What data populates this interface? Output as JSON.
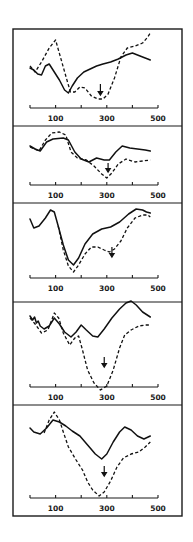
{
  "figure": {
    "width": 193,
    "height": 542,
    "frame": {
      "left": 13,
      "right": 182,
      "top": 29,
      "bottom": 516
    },
    "x_axis_px": {
      "x0": 30,
      "x500": 158
    },
    "panel_tops": [
      29,
      126,
      203,
      302,
      405
    ],
    "colors": {
      "ink": "#111111",
      "background": "#ffffff"
    }
  },
  "chart_data": {
    "type": "line",
    "title": "",
    "xlabel": "",
    "ylabel": "",
    "xlim": [
      0,
      500
    ],
    "x_tick_positions": [
      0,
      100,
      200,
      300,
      400,
      500
    ],
    "x_tick_labels": [
      "100",
      "300",
      "500"
    ],
    "x_tick_label_positions": [
      100,
      300,
      500
    ],
    "grid": false,
    "legend": null,
    "panels": [
      {
        "index": 1,
        "axis_y": 108,
        "label_y": 121,
        "arrow": {
          "x": 275,
          "y_top": 84,
          "y_bottom": 95
        },
        "series": [
          {
            "name": "solid",
            "style": "solid",
            "points": [
              [
                0,
                68
              ],
              [
                15,
                70
              ],
              [
                30,
                74
              ],
              [
                45,
                75
              ],
              [
                60,
                66
              ],
              [
                75,
                64
              ],
              [
                95,
                72
              ],
              [
                115,
                80
              ],
              [
                135,
                90
              ],
              [
                150,
                93
              ],
              [
                165,
                86
              ],
              [
                185,
                78
              ],
              [
                210,
                72
              ],
              [
                235,
                69
              ],
              [
                260,
                66
              ],
              [
                285,
                64
              ],
              [
                315,
                62
              ],
              [
                345,
                59
              ],
              [
                375,
                55
              ],
              [
                400,
                53
              ],
              [
                420,
                55
              ],
              [
                440,
                57
              ],
              [
                460,
                59
              ],
              [
                470,
                60
              ]
            ]
          },
          {
            "name": "dashed",
            "style": "dashed",
            "points": [
              [
                0,
                66
              ],
              [
                20,
                72
              ],
              [
                45,
                62
              ],
              [
                75,
                48
              ],
              [
                100,
                40
              ],
              [
                120,
                58
              ],
              [
                140,
                76
              ],
              [
                158,
                92
              ],
              [
                175,
                92
              ],
              [
                195,
                87
              ],
              [
                215,
                88
              ],
              [
                240,
                96
              ],
              [
                265,
                99
              ],
              [
                285,
                99
              ],
              [
                305,
                94
              ],
              [
                330,
                78
              ],
              [
                355,
                57
              ],
              [
                380,
                48
              ],
              [
                410,
                46
              ],
              [
                440,
                43
              ],
              [
                460,
                37
              ],
              [
                470,
                33
              ]
            ]
          }
        ]
      },
      {
        "index": 2,
        "axis_y": 185,
        "label_y": 198,
        "arrow": {
          "x": 305,
          "y_top": 163,
          "y_bottom": 172
        },
        "series": [
          {
            "name": "solid",
            "style": "solid",
            "points": [
              [
                0,
                146
              ],
              [
                20,
                149
              ],
              [
                40,
                151
              ],
              [
                65,
                142
              ],
              [
                90,
                139
              ],
              [
                130,
                138
              ],
              [
                150,
                140
              ],
              [
                175,
                152
              ],
              [
                200,
                159
              ],
              [
                230,
                162
              ],
              [
                260,
                158
              ],
              [
                290,
                160
              ],
              [
                310,
                160
              ],
              [
                335,
                152
              ],
              [
                360,
                146
              ],
              [
                390,
                148
              ],
              [
                420,
                149
              ],
              [
                450,
                150
              ],
              [
                470,
                151
              ]
            ]
          },
          {
            "name": "dashed",
            "style": "dashed",
            "points": [
              [
                0,
                147
              ],
              [
                35,
                151
              ],
              [
                60,
                140
              ],
              [
                85,
                133
              ],
              [
                115,
                132
              ],
              [
                140,
                135
              ],
              [
                160,
                152
              ],
              [
                185,
                158
              ],
              [
                220,
                160
              ],
              [
                250,
                166
              ],
              [
                280,
                174
              ],
              [
                300,
                178
              ],
              [
                320,
                173
              ],
              [
                345,
                164
              ],
              [
                375,
                159
              ],
              [
                410,
                162
              ],
              [
                440,
                161
              ],
              [
                470,
                160
              ]
            ]
          }
        ]
      },
      {
        "index": 3,
        "axis_y": 278,
        "label_y": 291,
        "arrow": {
          "x": 320,
          "y_top": 247,
          "y_bottom": 257
        },
        "series": [
          {
            "name": "solid",
            "style": "solid",
            "points": [
              [
                0,
                219
              ],
              [
                15,
                228
              ],
              [
                35,
                226
              ],
              [
                60,
                218
              ],
              [
                80,
                210
              ],
              [
                95,
                212
              ],
              [
                110,
                226
              ],
              [
                130,
                245
              ],
              [
                150,
                260
              ],
              [
                170,
                265
              ],
              [
                190,
                258
              ],
              [
                215,
                244
              ],
              [
                245,
                234
              ],
              [
                280,
                229
              ],
              [
                315,
                227
              ],
              [
                350,
                222
              ],
              [
                385,
                214
              ],
              [
                415,
                209
              ],
              [
                440,
                210
              ],
              [
                455,
                212
              ],
              [
                470,
                213
              ]
            ]
          },
          {
            "name": "dashed",
            "style": "dashed",
            "points": [
              [
                110,
                226
              ],
              [
                130,
                250
              ],
              [
                150,
                266
              ],
              [
                170,
                272
              ],
              [
                190,
                265
              ],
              [
                215,
                254
              ],
              [
                240,
                247
              ],
              [
                265,
                247
              ],
              [
                290,
                250
              ],
              [
                310,
                252
              ],
              [
                330,
                249
              ],
              [
                355,
                241
              ],
              [
                380,
                228
              ],
              [
                410,
                218
              ],
              [
                440,
                215
              ],
              [
                460,
                215
              ],
              [
                470,
                217
              ]
            ]
          }
        ]
      },
      {
        "index": 4,
        "axis_y": 387,
        "label_y": 400,
        "arrow": {
          "x": 290,
          "y_top": 357,
          "y_bottom": 367
        },
        "series": [
          {
            "name": "solid",
            "style": "solid",
            "points": [
              [
                0,
                316
              ],
              [
                10,
                320
              ],
              [
                18,
                317
              ],
              [
                25,
                323
              ],
              [
                32,
                321
              ],
              [
                40,
                326
              ],
              [
                55,
                329
              ],
              [
                75,
                326
              ],
              [
                95,
                318
              ],
              [
                115,
                324
              ],
              [
                135,
                332
              ],
              [
                160,
                337
              ],
              [
                180,
                332
              ],
              [
                200,
                325
              ],
              [
                220,
                330
              ],
              [
                245,
                336
              ],
              [
                265,
                337
              ],
              [
                290,
                329
              ],
              [
                320,
                318
              ],
              [
                350,
                309
              ],
              [
                375,
                303
              ],
              [
                395,
                301
              ],
              [
                415,
                305
              ],
              [
                440,
                312
              ],
              [
                470,
                317
              ]
            ]
          },
          {
            "name": "dashed",
            "style": "dashed",
            "points": [
              [
                0,
                318
              ],
              [
                20,
                324
              ],
              [
                45,
                333
              ],
              [
                70,
                330
              ],
              [
                95,
                313
              ],
              [
                112,
                318
              ],
              [
                130,
                333
              ],
              [
                155,
                345
              ],
              [
                175,
                338
              ],
              [
                190,
                336
              ],
              [
                205,
                350
              ],
              [
                225,
                370
              ],
              [
                250,
                383
              ],
              [
                275,
                390
              ],
              [
                300,
                386
              ],
              [
                325,
                370
              ],
              [
                350,
                348
              ],
              [
                370,
                335
              ],
              [
                395,
                330
              ],
              [
                425,
                326
              ],
              [
                450,
                325
              ],
              [
                470,
                325
              ]
            ]
          }
        ]
      },
      {
        "index": 5,
        "axis_y": 498,
        "label_y": 511,
        "arrow": {
          "x": 290,
          "y_top": 466,
          "y_bottom": 476
        },
        "series": [
          {
            "name": "solid",
            "style": "solid",
            "points": [
              [
                0,
                428
              ],
              [
                15,
                432
              ],
              [
                40,
                434
              ],
              [
                65,
                428
              ],
              [
                90,
                420
              ],
              [
                115,
                422
              ],
              [
                140,
                426
              ],
              [
                165,
                431
              ],
              [
                195,
                436
              ],
              [
                225,
                445
              ],
              [
                255,
                454
              ],
              [
                280,
                459
              ],
              [
                300,
                454
              ],
              [
                325,
                442
              ],
              [
                350,
                432
              ],
              [
                370,
                427
              ],
              [
                395,
                430
              ],
              [
                420,
                436
              ],
              [
                445,
                439
              ],
              [
                470,
                436
              ]
            ]
          },
          {
            "name": "dashed",
            "style": "dashed",
            "points": [
              [
                55,
                433
              ],
              [
                75,
                420
              ],
              [
                95,
                412
              ],
              [
                115,
                420
              ],
              [
                130,
                432
              ],
              [
                150,
                447
              ],
              [
                180,
                460
              ],
              [
                205,
                470
              ],
              [
                225,
                482
              ],
              [
                245,
                490
              ],
              [
                270,
                496
              ],
              [
                290,
                492
              ],
              [
                315,
                481
              ],
              [
                340,
                467
              ],
              [
                365,
                458
              ],
              [
                395,
                454
              ],
              [
                425,
                452
              ],
              [
                450,
                447
              ],
              [
                470,
                442
              ]
            ]
          }
        ]
      }
    ]
  }
}
